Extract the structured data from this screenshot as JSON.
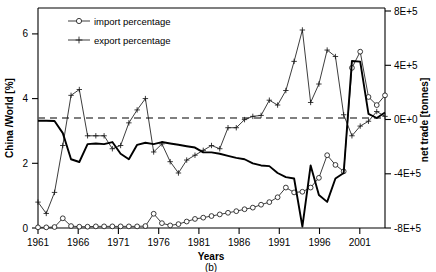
{
  "figure": {
    "caption": "(b)",
    "xlabel": "Years",
    "ylabel_left": "China /World [%]",
    "ylabel_right": "net trade [tonnes]"
  },
  "legend": {
    "items": [
      {
        "label": "import percentage",
        "marker": "open-circle"
      },
      {
        "label": "export percentage",
        "marker": "plus"
      }
    ]
  },
  "axes": {
    "x_ticks": [
      "1961",
      "1966",
      "1971",
      "1976",
      "1981",
      "1986",
      "1991",
      "1996",
      "2001"
    ],
    "y_left_ticks": [
      "0",
      "2",
      "4",
      "6"
    ],
    "y_right_ticks": [
      "8E+5",
      "4E+5",
      "0E+0",
      "-4E+5",
      "-8E+5"
    ]
  },
  "chart_data": {
    "type": "line",
    "title": "",
    "subtitle": "",
    "caption": "(b)",
    "xlabel": "Years",
    "ylabel": "China /World [%]",
    "ylabel_secondary": "net trade [tonnes]",
    "xlim": [
      1961,
      2003
    ],
    "ylim": [
      0,
      6.8
    ],
    "ylim_secondary": [
      -800000,
      800000
    ],
    "grid": false,
    "legend_position": "top-left",
    "reference_line": {
      "axis": "secondary",
      "value": 0,
      "style": "dashed",
      "color": "#555555"
    },
    "x": [
      1961,
      1962,
      1963,
      1964,
      1965,
      1966,
      1967,
      1968,
      1969,
      1970,
      1971,
      1972,
      1973,
      1974,
      1975,
      1976,
      1977,
      1978,
      1979,
      1980,
      1981,
      1982,
      1983,
      1984,
      1985,
      1986,
      1987,
      1988,
      1989,
      1990,
      1991,
      1992,
      1993,
      1994,
      1995,
      1996,
      1997,
      1998,
      1999,
      2000,
      2001,
      2002,
      2003
    ],
    "series": [
      {
        "name": "import percentage",
        "axis": "left",
        "marker": "open-circle",
        "units": "%",
        "values": [
          0.02,
          0.02,
          0.03,
          0.3,
          0.06,
          0.04,
          0.04,
          0.05,
          0.05,
          0.05,
          0.05,
          0.05,
          0.05,
          0.06,
          0.44,
          0.15,
          0.08,
          0.12,
          0.2,
          0.28,
          0.32,
          0.37,
          0.42,
          0.47,
          0.52,
          0.58,
          0.63,
          0.72,
          0.8,
          0.95,
          1.25,
          1.1,
          1.12,
          1.25,
          1.55,
          2.25,
          1.95,
          1.75,
          4.95,
          5.45,
          4.05,
          3.8,
          4.1
        ]
      },
      {
        "name": "export percentage",
        "axis": "left",
        "marker": "plus",
        "units": "%",
        "values": [
          0.8,
          0.45,
          1.1,
          2.55,
          4.1,
          4.28,
          2.85,
          2.85,
          2.85,
          2.45,
          2.55,
          3.25,
          3.65,
          4.0,
          2.35,
          2.6,
          2.05,
          1.7,
          2.1,
          2.25,
          2.4,
          2.55,
          2.45,
          3.1,
          3.1,
          3.35,
          3.45,
          3.48,
          3.95,
          3.8,
          4.25,
          5.15,
          6.12,
          3.88,
          4.45,
          5.5,
          5.3,
          3.5,
          2.85,
          3.15,
          3.3,
          3.6,
          3.45
        ]
      },
      {
        "name": "net trade",
        "axis": "right",
        "marker": "none",
        "units": "tonnes",
        "values": [
          -20000,
          -20000,
          -22000,
          -110000,
          -300000,
          -320000,
          -190000,
          -185000,
          -190000,
          -175000,
          -260000,
          -300000,
          -195000,
          -180000,
          -190000,
          -175000,
          -185000,
          -195000,
          -205000,
          -215000,
          -250000,
          -250000,
          -260000,
          -275000,
          -290000,
          -300000,
          -330000,
          -345000,
          -350000,
          -400000,
          -430000,
          -440000,
          -790000,
          -345000,
          -560000,
          -610000,
          -440000,
          -400000,
          415000,
          410000,
          30000,
          0,
          40000
        ]
      }
    ]
  }
}
